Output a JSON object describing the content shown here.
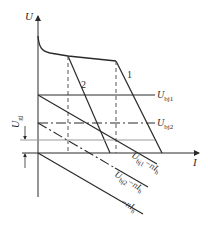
{
  "diagram": {
    "axes": {
      "y_label": "U",
      "x_label": "I"
    },
    "curves": {
      "curve_1_label": "1",
      "curve_2_label": "2"
    },
    "levels": {
      "u_bj1": "U",
      "u_bj1_sub": "bj1",
      "u_bj2": "U",
      "u_bj2_sub": "bj2",
      "u_gj": "U",
      "u_gj_sub": "gj"
    },
    "load_lines": {
      "line_1_main": "U",
      "line_1_sub": "bj1",
      "line_1_rest": "−nI",
      "line_1_rest_sub": "h",
      "line_2_main": "U",
      "line_2_sub": "bj2",
      "line_2_rest": "−nI",
      "line_2_rest_sub": "h",
      "line_3_main": "−nI",
      "line_3_sub": "h"
    },
    "colors": {
      "line": "#2a2a2a",
      "dashed": "#555555",
      "gray_line": "#9a9a9a"
    }
  }
}
